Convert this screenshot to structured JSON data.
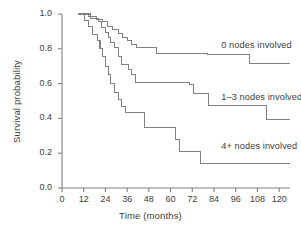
{
  "chart_data": {
    "type": "line",
    "subtype": "kaplan-meier-step",
    "title": "",
    "subtitle": "",
    "xlabel": "Time (months)",
    "ylabel": "Survival probability",
    "xlim": [
      0,
      126
    ],
    "ylim": [
      0.0,
      1.0
    ],
    "grid": false,
    "legend_position": "inline-right-of-curves",
    "xticks": [
      0,
      12,
      24,
      36,
      48,
      60,
      72,
      84,
      96,
      108,
      120
    ],
    "xtick_labels": [
      "0",
      "12",
      "24",
      "36",
      "48",
      "60",
      "72",
      "84",
      "96",
      "108",
      "120"
    ],
    "yticks": [
      0.0,
      0.2,
      0.4,
      0.6,
      0.8,
      1.0
    ],
    "ytick_labels": [
      "0.0",
      "0.2",
      "0.4",
      "0.6",
      "0.8",
      "1.0"
    ],
    "line_color": "#808080",
    "axis_color": "#808080",
    "series": [
      {
        "name": "0 nodes involved",
        "label": "0 nodes involved",
        "label_x": 88,
        "label_y": 0.815,
        "steps": [
          [
            9.0,
            1.0
          ],
          [
            14.5,
            1.0
          ],
          [
            14.5,
            0.985
          ],
          [
            19.0,
            0.985
          ],
          [
            19.0,
            0.97
          ],
          [
            22.5,
            0.97
          ],
          [
            22.5,
            0.955
          ],
          [
            25.0,
            0.955
          ],
          [
            25.0,
            0.93
          ],
          [
            28.0,
            0.93
          ],
          [
            28.0,
            0.91
          ],
          [
            31.0,
            0.91
          ],
          [
            31.0,
            0.89
          ],
          [
            33.5,
            0.89
          ],
          [
            33.5,
            0.865
          ],
          [
            36.0,
            0.865
          ],
          [
            36.0,
            0.845
          ],
          [
            38.5,
            0.845
          ],
          [
            38.5,
            0.825
          ],
          [
            41.0,
            0.825
          ],
          [
            41.0,
            0.805
          ],
          [
            52.0,
            0.805
          ],
          [
            52.0,
            0.775
          ],
          [
            80.5,
            0.775
          ],
          [
            80.5,
            0.765
          ],
          [
            103.5,
            0.765
          ],
          [
            103.5,
            0.715
          ],
          [
            126.0,
            0.715
          ]
        ]
      },
      {
        "name": "1-3 nodes involved",
        "label": "1–3 nodes involved",
        "label_x": 88,
        "label_y": 0.515,
        "steps": [
          [
            9.5,
            1.0
          ],
          [
            16.0,
            1.0
          ],
          [
            16.0,
            0.975
          ],
          [
            20.0,
            0.975
          ],
          [
            20.0,
            0.955
          ],
          [
            22.0,
            0.955
          ],
          [
            22.0,
            0.925
          ],
          [
            24.0,
            0.925
          ],
          [
            24.0,
            0.895
          ],
          [
            25.5,
            0.895
          ],
          [
            25.5,
            0.865
          ],
          [
            27.0,
            0.865
          ],
          [
            27.0,
            0.835
          ],
          [
            29.0,
            0.835
          ],
          [
            29.0,
            0.805
          ],
          [
            31.0,
            0.805
          ],
          [
            31.0,
            0.755
          ],
          [
            33.0,
            0.755
          ],
          [
            33.0,
            0.71
          ],
          [
            36.5,
            0.71
          ],
          [
            36.5,
            0.68
          ],
          [
            38.5,
            0.68
          ],
          [
            38.5,
            0.65
          ],
          [
            40.5,
            0.65
          ],
          [
            40.5,
            0.605
          ],
          [
            70.5,
            0.605
          ],
          [
            70.5,
            0.595
          ],
          [
            72.5,
            0.595
          ],
          [
            72.5,
            0.545
          ],
          [
            81.0,
            0.545
          ],
          [
            81.0,
            0.475
          ],
          [
            113.0,
            0.475
          ],
          [
            113.0,
            0.395
          ],
          [
            126.0,
            0.395
          ]
        ]
      },
      {
        "name": "4+ nodes involved",
        "label": "4+ nodes involved",
        "label_x": 88,
        "label_y": 0.235,
        "steps": [
          [
            9.0,
            1.0
          ],
          [
            12.5,
            1.0
          ],
          [
            12.5,
            0.965
          ],
          [
            14.5,
            0.965
          ],
          [
            14.5,
            0.93
          ],
          [
            17.0,
            0.93
          ],
          [
            17.0,
            0.88
          ],
          [
            19.5,
            0.88
          ],
          [
            19.5,
            0.845
          ],
          [
            21.0,
            0.845
          ],
          [
            21.0,
            0.8
          ],
          [
            22.5,
            0.8
          ],
          [
            22.5,
            0.755
          ],
          [
            24.0,
            0.755
          ],
          [
            24.0,
            0.7
          ],
          [
            25.5,
            0.7
          ],
          [
            25.5,
            0.65
          ],
          [
            27.0,
            0.65
          ],
          [
            27.0,
            0.6
          ],
          [
            29.0,
            0.6
          ],
          [
            29.0,
            0.55
          ],
          [
            31.0,
            0.55
          ],
          [
            31.0,
            0.51
          ],
          [
            33.0,
            0.51
          ],
          [
            33.0,
            0.47
          ],
          [
            35.0,
            0.47
          ],
          [
            35.0,
            0.435
          ],
          [
            45.5,
            0.435
          ],
          [
            45.5,
            0.35
          ],
          [
            62.5,
            0.35
          ],
          [
            62.5,
            0.28
          ],
          [
            65.0,
            0.28
          ],
          [
            65.0,
            0.21
          ],
          [
            76.5,
            0.21
          ],
          [
            76.5,
            0.14
          ],
          [
            126.0,
            0.14
          ]
        ]
      }
    ]
  }
}
